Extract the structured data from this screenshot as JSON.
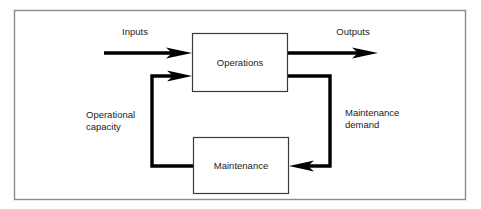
{
  "diagram": {
    "frame": {
      "stroke_color": "#8c8c8c",
      "background": "#ffffff"
    },
    "boxes": [
      {
        "id": "operations",
        "label": "Operations",
        "x": 192,
        "y": 33,
        "width": 96,
        "height": 59,
        "stroke_color": "#3a3a3a"
      },
      {
        "id": "maintenance",
        "label": "Maintenance",
        "x": 193,
        "y": 137,
        "width": 96,
        "height": 57,
        "stroke_color": "#3a3a3a"
      }
    ],
    "io_labels": [
      {
        "id": "inputs",
        "text": "Inputs",
        "x": 135,
        "y": 35
      },
      {
        "id": "outputs",
        "text": "Outputs",
        "x": 353,
        "y": 35
      }
    ],
    "flow_labels": [
      {
        "id": "operational-capacity",
        "lines": [
          "Operational",
          "capacity"
        ],
        "x": 86,
        "y": 118
      },
      {
        "id": "maintenance-demand",
        "lines": [
          "Maintenance",
          "demand"
        ],
        "x": 345,
        "y": 116
      }
    ],
    "arrow_color": "#000000",
    "arrows": [
      {
        "id": "input-arrow",
        "from": "external",
        "to": "operations",
        "direction": "right"
      },
      {
        "id": "output-arrow",
        "from": "operations",
        "to": "external",
        "direction": "right"
      },
      {
        "id": "operational-capacity-arrow",
        "from": "maintenance",
        "to": "operations",
        "direction": "right"
      },
      {
        "id": "maintenance-demand-arrow",
        "from": "operations",
        "to": "maintenance",
        "direction": "left"
      }
    ]
  }
}
